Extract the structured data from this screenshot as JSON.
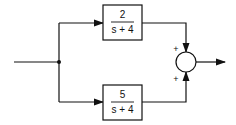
{
  "diagram": {
    "type": "block-diagram",
    "blocks": [
      {
        "id": "G1",
        "numerator": "2",
        "denominator": "s + 4"
      },
      {
        "id": "G2",
        "numerator": "5",
        "denominator": "s + 4"
      }
    ],
    "summing_junction": {
      "inputs": [
        {
          "from": "G1",
          "sign": "+"
        },
        {
          "from": "G2",
          "sign": "+"
        }
      ]
    },
    "connections": [
      {
        "from": "input",
        "to": "branch-point"
      },
      {
        "from": "branch-point",
        "to": "G1"
      },
      {
        "from": "branch-point",
        "to": "G2"
      },
      {
        "from": "G1",
        "to": "summing-junction"
      },
      {
        "from": "G2",
        "to": "summing-junction"
      },
      {
        "from": "summing-junction",
        "to": "output"
      }
    ]
  }
}
